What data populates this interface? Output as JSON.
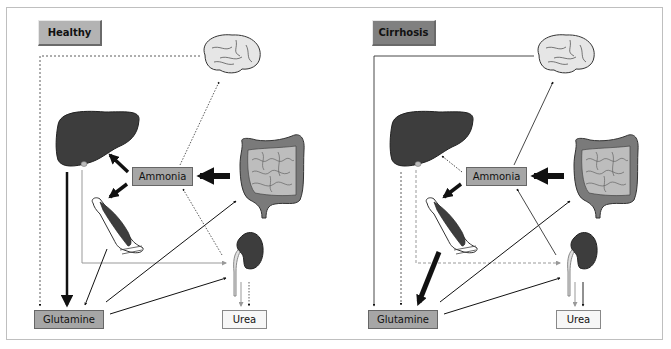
{
  "figure": {
    "type": "comparative physiology diagram"
  },
  "panels": [
    {
      "id": "healthy",
      "title": "Healthy",
      "title_color": "#b3b3b3",
      "nodes": {
        "ammonia": "Ammonia",
        "glutamine": "Glutamine",
        "urea": "Urea"
      },
      "organs": [
        "brain",
        "liver",
        "intestine",
        "muscle",
        "kidney"
      ],
      "flows": [
        {
          "from": "intestine",
          "to": "ammonia",
          "style": "thick"
        },
        {
          "from": "ammonia",
          "to": "liver",
          "style": "thick"
        },
        {
          "from": "ammonia",
          "to": "muscle",
          "style": "thick"
        },
        {
          "from": "ammonia",
          "to": "brain",
          "style": "dotted"
        },
        {
          "from": "liver",
          "to": "glutamine",
          "style": "thick-solid"
        },
        {
          "from": "liver",
          "to": "glutamine",
          "style": "dashed",
          "via": "brain-loop"
        },
        {
          "from": "liver",
          "to": "kidney",
          "style": "gray-solid"
        },
        {
          "from": "muscle",
          "to": "glutamine",
          "style": "solid"
        },
        {
          "from": "glutamine",
          "to": "intestine",
          "style": "solid"
        },
        {
          "from": "glutamine",
          "to": "kidney",
          "style": "solid"
        },
        {
          "from": "kidney",
          "to": "ammonia",
          "style": "dotted"
        },
        {
          "from": "kidney",
          "to": "urea",
          "style": "gray-solid"
        },
        {
          "from": "kidney",
          "to": "urea",
          "style": "dotted"
        }
      ]
    },
    {
      "id": "cirrhosis",
      "title": "Cirrhosis",
      "title_color": "#808080",
      "nodes": {
        "ammonia": "Ammonia",
        "glutamine": "Glutamine",
        "urea": "Urea"
      },
      "organs": [
        "brain",
        "liver",
        "intestine",
        "muscle",
        "kidney"
      ],
      "flows": [
        {
          "from": "intestine",
          "to": "ammonia",
          "style": "thick"
        },
        {
          "from": "ammonia",
          "to": "liver",
          "style": "dotted"
        },
        {
          "from": "ammonia",
          "to": "muscle",
          "style": "thick"
        },
        {
          "from": "ammonia",
          "to": "brain",
          "style": "solid"
        },
        {
          "from": "brain",
          "to": "glutamine",
          "style": "solid",
          "via": "brain-loop"
        },
        {
          "from": "liver",
          "to": "glutamine",
          "style": "dashed"
        },
        {
          "from": "liver",
          "to": "kidney",
          "style": "gray-dashed"
        },
        {
          "from": "muscle",
          "to": "glutamine",
          "style": "very-thick"
        },
        {
          "from": "glutamine",
          "to": "intestine",
          "style": "solid"
        },
        {
          "from": "glutamine",
          "to": "kidney",
          "style": "solid"
        },
        {
          "from": "kidney",
          "to": "ammonia",
          "style": "solid"
        },
        {
          "from": "kidney",
          "to": "urea",
          "style": "gray-solid"
        },
        {
          "from": "kidney",
          "to": "urea",
          "style": "solid"
        }
      ]
    }
  ]
}
